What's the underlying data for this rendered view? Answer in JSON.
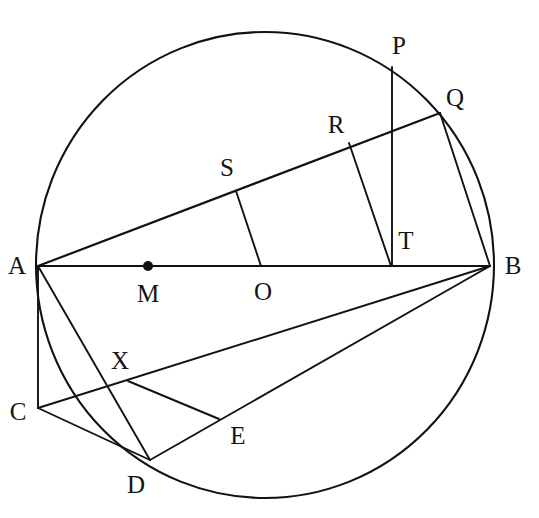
{
  "figure": {
    "background_color": "#ffffff",
    "ink_color": "#121212",
    "width": 539,
    "height": 518
  },
  "circle": {
    "name": "main-circle",
    "center_x": 265,
    "center_y": 265,
    "radius_x": 229,
    "radius_y": 233
  },
  "points": {
    "A": {
      "label": "A",
      "x": 38,
      "y": 266,
      "label_x": 17,
      "label_y": 265,
      "on_circle": true
    },
    "B": {
      "label": "B",
      "x": 490,
      "y": 266,
      "label_x": 513,
      "label_y": 265,
      "on_circle": true
    },
    "O": {
      "label": "O",
      "x": 261,
      "y": 265,
      "label_x": 263,
      "label_y": 291,
      "on_circle": false
    },
    "M": {
      "label": "M",
      "x": 148,
      "y": 266,
      "label_x": 148,
      "label_y": 293,
      "on_circle": false,
      "has_dot": true
    },
    "P": {
      "label": "P",
      "x": 392,
      "y": 67,
      "label_x": 399,
      "label_y": 45,
      "on_circle": true
    },
    "Q": {
      "label": "Q",
      "x": 440,
      "y": 113,
      "label_x": 455,
      "label_y": 97,
      "on_circle": true
    },
    "R": {
      "label": "R",
      "x": 349,
      "y": 143,
      "label_x": 336,
      "label_y": 124,
      "on_circle": false
    },
    "S": {
      "label": "S",
      "x": 236,
      "y": 191,
      "label_x": 227,
      "label_y": 167,
      "on_circle": false
    },
    "T": {
      "label": "T",
      "x": 392,
      "y": 265,
      "label_x": 406,
      "label_y": 240,
      "on_circle": false
    },
    "C": {
      "label": "C",
      "x": 38,
      "y": 408,
      "label_x": 18,
      "label_y": 411,
      "on_circle": false
    },
    "D": {
      "label": "D",
      "x": 150,
      "y": 460,
      "label_x": 136,
      "label_y": 484,
      "on_circle": true
    },
    "E": {
      "label": "E",
      "x": 218,
      "y": 418,
      "label_x": 238,
      "label_y": 435,
      "on_circle": false
    },
    "X": {
      "label": "X",
      "x": 128,
      "y": 381,
      "label_x": 120,
      "label_y": 360,
      "on_circle": false
    }
  },
  "segments": [
    {
      "name": "segment-AB",
      "from": "A",
      "to": "B"
    },
    {
      "name": "segment-AQ",
      "from": "A",
      "to": "Q"
    },
    {
      "name": "segment-PT",
      "from": "P",
      "to": "T"
    },
    {
      "name": "segment-RT",
      "from": "R",
      "to": "T"
    },
    {
      "name": "segment-SO",
      "from": "S",
      "to": "O"
    },
    {
      "name": "segment-QB",
      "from": "Q",
      "to": "B"
    },
    {
      "name": "segment-AC",
      "from": "A",
      "to": "C"
    },
    {
      "name": "segment-AD",
      "from": "A",
      "to": "D"
    },
    {
      "name": "segment-CD",
      "from": "C",
      "to": "D"
    },
    {
      "name": "segment-CB",
      "from": "C",
      "to": "B"
    },
    {
      "name": "segment-DB",
      "from": "D",
      "to": "B"
    },
    {
      "name": "segment-XE",
      "from": "X",
      "to": "E"
    }
  ],
  "labels_order": [
    "P",
    "Q",
    "R",
    "S",
    "A",
    "M",
    "O",
    "T",
    "B",
    "X",
    "C",
    "E",
    "D"
  ]
}
